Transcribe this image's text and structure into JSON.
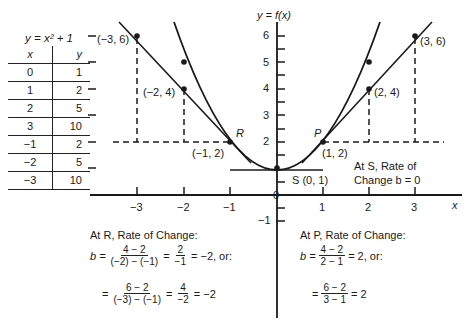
{
  "table": {
    "caption": "y = x² + 1",
    "headers": [
      "x",
      "y"
    ],
    "rows": [
      [
        "0",
        "1"
      ],
      [
        "1",
        "2"
      ],
      [
        "2",
        "5"
      ],
      [
        "3",
        "10"
      ],
      [
        "−1",
        "2"
      ],
      [
        "−2",
        "5"
      ],
      [
        "−3",
        "10"
      ]
    ]
  },
  "graph": {
    "y_axis_label": "y = f(x)",
    "x_axis_label": "x",
    "x_ticks": [
      "−3",
      "−2",
      "−1",
      "0",
      "1",
      "2",
      "3"
    ],
    "y_ticks": [
      "6",
      "5",
      "4",
      "3",
      "2",
      "−1"
    ],
    "points": {
      "neg3_6": "(−3, 6)",
      "neg2_4": "(−2, 4)",
      "neg1_2": "(−1, 2)",
      "pos1_2": "(1, 2)",
      "pos2_4": "(2, 4)",
      "pos3_6": "(3, 6)",
      "s": "S (0, 1)"
    },
    "point_R": "R",
    "point_P": "P"
  },
  "notes": {
    "at_s_line1": "At S, Rate of",
    "at_s_line2": "Change b = 0",
    "at_r_title": "At R, Rate of Change:",
    "at_r_eq1": {
      "lhs": "b =",
      "num": "4 − 2",
      "den": "(−2) − (−1)",
      "mid": "=",
      "num2": "2",
      "den2": "−1",
      "rhs": "= −2, or:"
    },
    "at_r_eq2": {
      "lhs": "=",
      "num": "6 − 2",
      "den": "(−3) − (−1)",
      "mid": "=",
      "num2": "4",
      "den2": "−2",
      "rhs": "= −2"
    },
    "at_p_title": "At P, Rate of Change:",
    "at_p_eq1": {
      "lhs": "b =",
      "num": "4 − 2",
      "den": "2 − 1",
      "rhs": "= 2, or:"
    },
    "at_p_eq2": {
      "lhs": "=",
      "num": "6 − 2",
      "den": "3 − 1",
      "rhs": "= 2"
    }
  }
}
